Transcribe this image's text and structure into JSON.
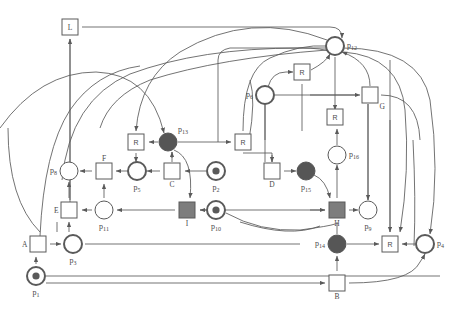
{
  "diagram": {
    "type": "petri-net",
    "colors": {
      "stroke": "#5a5a5a",
      "dark_fill": "#565656",
      "light_fill": "#ffffff",
      "gray_fill": "#7d7d7d",
      "label": "#4a4a4a",
      "background": "#ffffff"
    },
    "places": [
      {
        "id": "p1",
        "label": "p",
        "sub": "1",
        "x": 36,
        "y": 276,
        "tokens": 1,
        "style": "token",
        "label_pos": "below"
      },
      {
        "id": "p2",
        "label": "p",
        "sub": "2",
        "x": 216,
        "y": 171,
        "tokens": 1,
        "style": "token",
        "label_pos": "below"
      },
      {
        "id": "p3",
        "label": "p",
        "sub": "3",
        "x": 73,
        "y": 244,
        "tokens": 0,
        "style": "thick",
        "label_pos": "below"
      },
      {
        "id": "p4",
        "label": "p",
        "sub": "4",
        "x": 425,
        "y": 244,
        "tokens": 0,
        "style": "thick",
        "label_pos": "right"
      },
      {
        "id": "p5",
        "label": "p",
        "sub": "5",
        "x": 137,
        "y": 171,
        "tokens": 0,
        "style": "thick",
        "label_pos": "below"
      },
      {
        "id": "p6",
        "label": "p",
        "sub": "6",
        "x": 265,
        "y": 95,
        "tokens": 0,
        "style": "thick",
        "label_pos": "left"
      },
      {
        "id": "p8",
        "label": "p",
        "sub": "8",
        "x": 69,
        "y": 171,
        "tokens": 0,
        "style": "thin",
        "label_pos": "left"
      },
      {
        "id": "p9",
        "label": "p",
        "sub": "9",
        "x": 368,
        "y": 210,
        "tokens": 0,
        "style": "thin",
        "label_pos": "below"
      },
      {
        "id": "p10",
        "label": "p",
        "sub": "10",
        "x": 216,
        "y": 210,
        "tokens": 1,
        "style": "token",
        "label_pos": "below"
      },
      {
        "id": "p11",
        "label": "p",
        "sub": "11",
        "x": 104,
        "y": 210,
        "tokens": 0,
        "style": "thin",
        "label_pos": "below"
      },
      {
        "id": "p12",
        "label": "p",
        "sub": "12",
        "x": 335,
        "y": 46,
        "tokens": 0,
        "style": "thick",
        "label_pos": "right"
      },
      {
        "id": "p13",
        "label": "p",
        "sub": "13",
        "x": 168,
        "y": 142,
        "tokens": 0,
        "style": "filled",
        "label_pos": "above-right"
      },
      {
        "id": "p14",
        "label": "p",
        "sub": "14",
        "x": 337,
        "y": 244,
        "tokens": 0,
        "style": "filled",
        "label_pos": "left"
      },
      {
        "id": "p15",
        "label": "p",
        "sub": "15",
        "x": 306,
        "y": 171,
        "tokens": 0,
        "style": "filled",
        "label_pos": "below"
      },
      {
        "id": "p16",
        "label": "p",
        "sub": "16",
        "x": 337,
        "y": 155,
        "tokens": 0,
        "style": "thin",
        "label_pos": "right"
      }
    ],
    "transitions": [
      {
        "id": "t_L",
        "label": "L",
        "x": 70,
        "y": 27,
        "fill": "light",
        "label_pos": "inside"
      },
      {
        "id": "t_R1",
        "label": "R",
        "x": 136,
        "y": 142,
        "fill": "light",
        "label_pos": "inside"
      },
      {
        "id": "t_R2",
        "label": "R",
        "x": 243,
        "y": 142,
        "fill": "light",
        "label_pos": "inside"
      },
      {
        "id": "t_R3",
        "label": "R",
        "x": 302,
        "y": 72,
        "fill": "light",
        "label_pos": "inside"
      },
      {
        "id": "t_R4",
        "label": "R",
        "x": 335,
        "y": 117,
        "fill": "light",
        "label_pos": "inside"
      },
      {
        "id": "t_R5",
        "label": "R",
        "x": 390,
        "y": 244,
        "fill": "light",
        "label_pos": "inside"
      },
      {
        "id": "t_F",
        "label": "F",
        "x": 104,
        "y": 171,
        "fill": "light",
        "label_pos": "above"
      },
      {
        "id": "t_C",
        "label": "C",
        "x": 172,
        "y": 171,
        "fill": "light",
        "label_pos": "below"
      },
      {
        "id": "t_D",
        "label": "D",
        "x": 272,
        "y": 171,
        "fill": "light",
        "label_pos": "below"
      },
      {
        "id": "t_E",
        "label": "E",
        "x": 69,
        "y": 210,
        "fill": "light",
        "label_pos": "left"
      },
      {
        "id": "t_I",
        "label": "I",
        "x": 187,
        "y": 210,
        "fill": "gray",
        "label_pos": "below"
      },
      {
        "id": "t_H",
        "label": "H",
        "x": 337,
        "y": 210,
        "fill": "gray",
        "label_pos": "below"
      },
      {
        "id": "t_G",
        "label": "G",
        "x": 370,
        "y": 95,
        "fill": "light",
        "label_pos": "below-right"
      },
      {
        "id": "t_A",
        "label": "A",
        "x": 38,
        "y": 244,
        "fill": "light",
        "label_pos": "left"
      },
      {
        "id": "t_B",
        "label": "B",
        "x": 337,
        "y": 283,
        "fill": "light",
        "label_pos": "below"
      }
    ],
    "arc_count": 46
  }
}
